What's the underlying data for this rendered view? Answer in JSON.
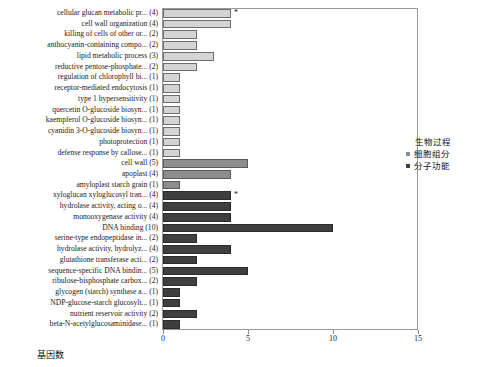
{
  "chart_data": {
    "type": "bar",
    "title": "",
    "subtitle": "",
    "xlabel": "基因数",
    "ylabel": "",
    "xlim": [
      0,
      15
    ],
    "xticks": [
      0,
      5,
      10,
      15
    ],
    "xticklabels": [
      "0",
      "5",
      "10",
      "15"
    ],
    "grid": false,
    "orientation": "horizontal",
    "legend": {
      "title": "生物过程",
      "position": "right",
      "entries": [
        {
          "label": "细胞组分",
          "color": "#8d8d8d"
        },
        {
          "label": "分子功能",
          "color": "#3f3f3f"
        }
      ]
    },
    "colors": {
      "biological_process": "#d4d4d4",
      "cellular_component": "#8d8d8d",
      "molecular_function": "#3f3f3f"
    },
    "significance_marker": "*",
    "categories": [
      "cellular glucan metabolic pr... (4)",
      "cell wall organization (4)",
      "killing of cells of other or... (2)",
      "anthocyanin-containing compo... (2)",
      "lipid metabolic process (3)",
      "reductive pentose-phosphate... (2)",
      "regulation of chlorophyll bi... (1)",
      "receptor-mediated endocytosis (1)",
      "type 1 hypersensitivity (1)",
      "quercetin O-glucoside biosyn... (1)",
      "kaempferol O-glucoside biosyn... (1)",
      "cyanidin 3-O-glucoside biosyn... (1)",
      "photoprotection (1)",
      "defense response by callose... (1)",
      "cell wall (5)",
      "apoplast (4)",
      "amyloplast starch grain (1)",
      "xyloglucan xyloglucosyl tran... (4)",
      "hydrolase activity, acting o... (4)",
      "monooxygenase activity (4)",
      "DNA binding (10)",
      "serine-type endopeptidase in... (2)",
      "hydrolase activity, hydrolyz... (4)",
      "glutathione transferase acti... (2)",
      "sequence-specific DNA bindin... (5)",
      "ribulose-bisphosphate carbox... (2)",
      "glycogen (starch) synthase a... (1)",
      "NDP-glucose-starch glucosylt... (1)",
      "nutrient reservoir activity (2)",
      "beta-N-acetylglucosaminidase... (1)"
    ],
    "values": [
      4,
      4,
      2,
      2,
      3,
      2,
      1,
      1,
      1,
      1,
      1,
      1,
      1,
      1,
      5,
      4,
      1,
      4,
      4,
      4,
      10,
      2,
      4,
      2,
      5,
      2,
      1,
      1,
      2,
      1
    ],
    "groups": [
      "biological_process",
      "biological_process",
      "biological_process",
      "biological_process",
      "biological_process",
      "biological_process",
      "biological_process",
      "biological_process",
      "biological_process",
      "biological_process",
      "biological_process",
      "biological_process",
      "biological_process",
      "biological_process",
      "cellular_component",
      "cellular_component",
      "cellular_component",
      "molecular_function",
      "molecular_function",
      "molecular_function",
      "molecular_function",
      "molecular_function",
      "molecular_function",
      "molecular_function",
      "molecular_function",
      "molecular_function",
      "molecular_function",
      "molecular_function",
      "molecular_function",
      "molecular_function"
    ],
    "starred": [
      true,
      false,
      false,
      false,
      false,
      false,
      false,
      false,
      false,
      false,
      false,
      false,
      false,
      false,
      false,
      false,
      false,
      true,
      false,
      false,
      false,
      false,
      false,
      false,
      false,
      false,
      false,
      false,
      false,
      false
    ]
  }
}
